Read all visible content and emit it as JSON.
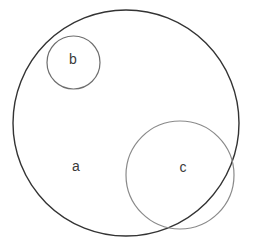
{
  "diagram": {
    "type": "euler-diagram",
    "width": 255,
    "height": 242,
    "background_color": "#ffffff",
    "sets": [
      {
        "id": "a",
        "label": "a",
        "shape": "circle",
        "cx": 126,
        "cy": 123,
        "r": 113,
        "stroke_color": "#333333",
        "stroke_width": 1.4,
        "fill": "none",
        "label_x": 76,
        "label_y": 167,
        "label_font_size": 14,
        "label_color": "#3a3a3a"
      },
      {
        "id": "b",
        "label": "b",
        "shape": "circle",
        "cx": 73.5,
        "cy": 62.5,
        "r": 26.5,
        "stroke_color": "#6e6e6e",
        "stroke_width": 1.2,
        "fill": "none",
        "label_x": 73,
        "label_y": 60,
        "label_font_size": 14,
        "label_color": "#3a3a3a"
      },
      {
        "id": "c",
        "label": "c",
        "shape": "circle",
        "cx": 180,
        "cy": 175,
        "r": 54,
        "stroke_color": "#8a8a8a",
        "stroke_width": 1.2,
        "fill": "none",
        "label_x": 183,
        "label_y": 168,
        "label_font_size": 14,
        "label_color": "#3a3a3a"
      }
    ],
    "relations": [
      "b is fully contained inside a",
      "c partially overlaps a",
      "b and c are disjoint"
    ]
  }
}
